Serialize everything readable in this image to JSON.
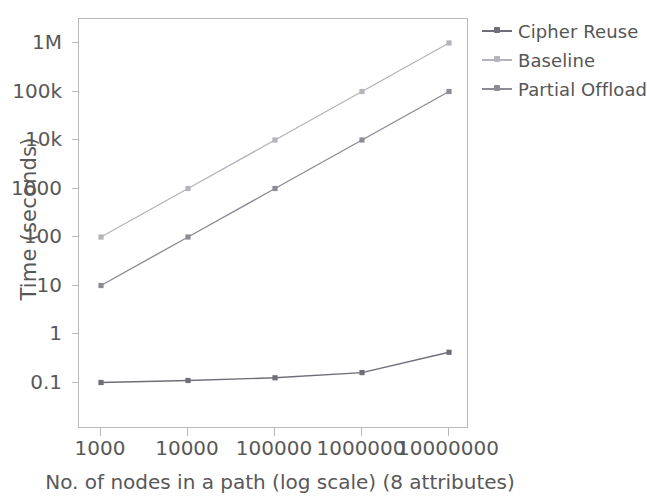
{
  "chart_data": {
    "type": "line",
    "title": "",
    "xlabel": "No. of nodes in a path (log scale)  (8 attributes)",
    "ylabel": "Time (seconds)",
    "x_scale": "log",
    "y_scale": "log",
    "grid": false,
    "legend_position": "right",
    "x": [
      1000,
      10000,
      100000,
      1000000,
      10000000
    ],
    "x_tick_labels": [
      "1000",
      "10000",
      "100000",
      "1000000",
      "10000000"
    ],
    "y_tick_values": [
      1000000,
      100000,
      10000,
      1000,
      100,
      10,
      1,
      0.1
    ],
    "y_tick_labels": [
      "1M",
      "100k",
      "10k",
      "1000",
      "100",
      "10",
      "1",
      "0.1"
    ],
    "ylim": [
      0.1,
      3000000
    ],
    "xlim": [
      1000,
      10000000
    ],
    "series": [
      {
        "name": "Cipher Reuse",
        "color": "#6e6e78",
        "marker": "square",
        "values": [
          0.1,
          0.11,
          0.125,
          0.16,
          0.42
        ]
      },
      {
        "name": "Baseline",
        "color": "#b4b4bc",
        "marker": "square",
        "values": [
          100,
          1000,
          10000,
          100000,
          1000000
        ]
      },
      {
        "name": "Partial Offload",
        "color": "#8c8c96",
        "marker": "square",
        "values": [
          10,
          100,
          1000,
          10000,
          100000
        ]
      }
    ]
  },
  "legend": {
    "items": [
      {
        "label": "Cipher Reuse",
        "color": "#6e6e78"
      },
      {
        "label": "Baseline",
        "color": "#b4b4bc"
      },
      {
        "label": "Partial Offload",
        "color": "#8c8c96"
      }
    ]
  },
  "axes": {
    "frame_color": "#b9b9b9",
    "text_color": "#585858"
  }
}
